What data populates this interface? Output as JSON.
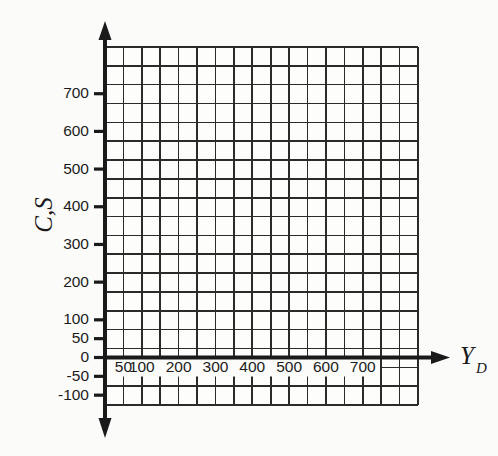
{
  "chart_data": {
    "type": "grid",
    "title": "",
    "subtitle": "",
    "xlabel": "Y_D",
    "xlabel_base": "Y",
    "xlabel_sub": "D",
    "ylabel": "C,S",
    "grid": true,
    "legend": null,
    "series": [],
    "annotations": [],
    "xlim": [
      0,
      850
    ],
    "ylim": [
      -150,
      800
    ],
    "x_ticks": [
      {
        "value": 50,
        "label": "50"
      },
      {
        "value": 100,
        "label": "100"
      },
      {
        "value": 200,
        "label": "200"
      },
      {
        "value": 300,
        "label": "300"
      },
      {
        "value": 400,
        "label": "400"
      },
      {
        "value": 500,
        "label": "500"
      },
      {
        "value": 600,
        "label": "600"
      },
      {
        "value": 700,
        "label": "700"
      }
    ],
    "y_ticks": [
      {
        "value": 700,
        "label": "700"
      },
      {
        "value": 600,
        "label": "600"
      },
      {
        "value": 500,
        "label": "500"
      },
      {
        "value": 400,
        "label": "400"
      },
      {
        "value": 300,
        "label": "300"
      },
      {
        "value": 200,
        "label": "200"
      },
      {
        "value": 100,
        "label": "100"
      },
      {
        "value": 50,
        "label": "50"
      },
      {
        "value": 0,
        "label": "0"
      },
      {
        "value": -50,
        "label": "-50"
      },
      {
        "value": -100,
        "label": "-100"
      }
    ],
    "grid_columns": 17,
    "grid_rows": 19,
    "cell_value_x": 50,
    "cell_value_y": 50,
    "colors": {
      "background": "#fbfbfa",
      "grid": "#2b2b2b",
      "axis": "#1a1a1a",
      "text": "#1b1b1b"
    }
  }
}
